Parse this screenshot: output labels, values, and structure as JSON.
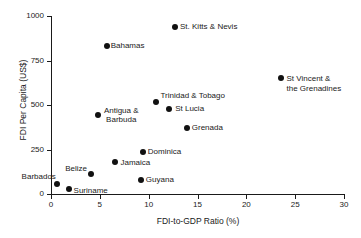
{
  "chart_data": {
    "type": "scatter",
    "title": "",
    "xlabel": "FDI-to-GDP Ratio (%)",
    "ylabel": "FDI Per Capita (US$)",
    "xlim": [
      0,
      30
    ],
    "ylim": [
      0,
      1000
    ],
    "xticks": [
      "0",
      "5",
      "10",
      "15",
      "20",
      "25",
      "30"
    ],
    "yticks": [
      "0",
      "250",
      "500",
      "750",
      "1000"
    ],
    "grid": false,
    "legend": "none",
    "marker_color": "#111111",
    "points": [
      {
        "label": "St. Kitts & Nevis",
        "x": 12.7,
        "y": 940
      },
      {
        "label": "Bahamas",
        "x": 5.7,
        "y": 830
      },
      {
        "label": "St Vincent & the Grenadines",
        "label_line1": "St Vincent &",
        "label_line2": "the Grenadines",
        "x": 23.5,
        "y": 650
      },
      {
        "label": "Trinidad & Tobago",
        "x": 10.8,
        "y": 515
      },
      {
        "label": "St Lucia",
        "x": 12.1,
        "y": 475
      },
      {
        "label": "Antigua & Barbuda",
        "label_line1": "Antigua &",
        "label_line2": "Barbuda",
        "x": 4.8,
        "y": 445
      },
      {
        "label": "Grenada",
        "x": 13.9,
        "y": 370
      },
      {
        "label": "Dominica",
        "x": 9.4,
        "y": 237
      },
      {
        "label": "Jamaica",
        "x": 6.6,
        "y": 178
      },
      {
        "label": "Belize",
        "x": 4.1,
        "y": 110
      },
      {
        "label": "Guyana",
        "x": 9.2,
        "y": 80
      },
      {
        "label": "Barbados",
        "x": 0.6,
        "y": 55
      },
      {
        "label": "Suriname",
        "x": 1.8,
        "y": 30
      }
    ]
  }
}
